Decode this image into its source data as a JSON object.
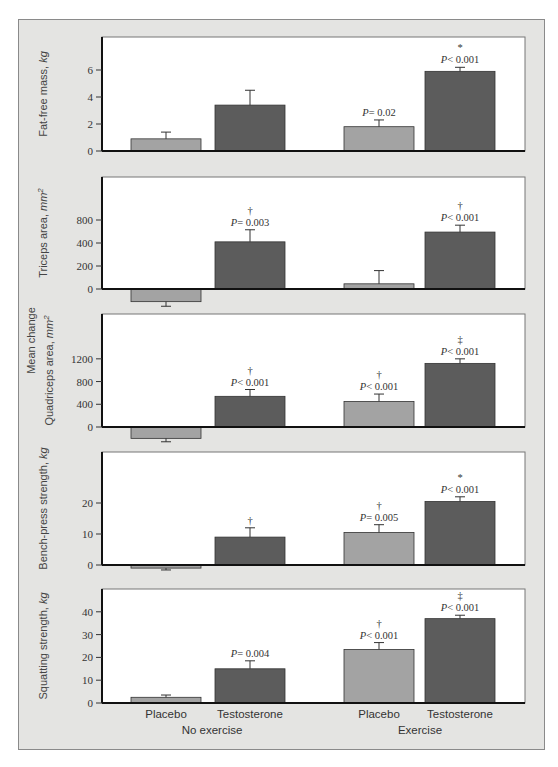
{
  "figure": {
    "background": "#e4e4e2",
    "shared_ylabel": "Mean change",
    "colors": {
      "placebo": "#a3a3a3",
      "testosterone": "#5c5c5c",
      "plot_bg": "#ffffff",
      "axis": "#111111"
    },
    "groups": [
      {
        "label": "No exercise",
        "bars": [
          "Placebo",
          "Testosterone"
        ]
      },
      {
        "label": "Exercise",
        "bars": [
          "Placebo",
          "Testosterone"
        ]
      }
    ]
  },
  "chart_data": [
    {
      "type": "bar",
      "title": "",
      "ylabel": "Fat-free mass, kg",
      "ylabel_main": "Fat-free mass, ",
      "ylabel_unit": "kg",
      "categories": [
        "No exercise / Placebo",
        "No exercise / Testosterone",
        "Exercise / Placebo",
        "Exercise / Testosterone"
      ],
      "values": [
        0.9,
        3.4,
        1.8,
        5.9
      ],
      "error_upper": [
        1.4,
        4.5,
        2.3,
        6.2
      ],
      "ylim": [
        0,
        7.8
      ],
      "ticks": [
        {
          "v": 0,
          "label": "0"
        },
        {
          "v": 2,
          "label": "2"
        },
        {
          "v": 4,
          "label": "4"
        },
        {
          "v": 6,
          "label": "6"
        }
      ],
      "annotations": [
        {
          "bar": 2,
          "symbol": "",
          "p": "P= 0.02"
        },
        {
          "bar": 3,
          "symbol": "*",
          "p": "P< 0.001"
        }
      ]
    },
    {
      "type": "bar",
      "ylabel": "Triceps area, mm2",
      "ylabel_main": "Triceps area, ",
      "ylabel_unit": "mm2",
      "categories": [
        "No exercise / Placebo",
        "No exercise / Testosterone",
        "Exercise / Placebo",
        "Exercise / Testosterone"
      ],
      "values": [
        -110,
        410,
        45,
        495
      ],
      "error_upper": [
        -150,
        515,
        160,
        555
      ],
      "ylim": [
        -150,
        850
      ],
      "ticks": [
        {
          "v": 0,
          "label": "0"
        },
        {
          "v": 200,
          "label": "200"
        },
        {
          "v": 400,
          "label": "400"
        },
        {
          "v": 600,
          "label": "800"
        }
      ],
      "annotations": [
        {
          "bar": 1,
          "symbol": "†",
          "p": "P= 0.003"
        },
        {
          "bar": 3,
          "symbol": "†",
          "p": "P< 0.001"
        }
      ]
    },
    {
      "type": "bar",
      "ylabel": "Quadriceps area, mm2",
      "ylabel_main": "Quadriceps area, ",
      "ylabel_unit": "mm2",
      "categories": [
        "No exercise / Placebo",
        "No exercise / Testosterone",
        "Exercise / Placebo",
        "Exercise / Testosterone"
      ],
      "values": [
        -200,
        540,
        450,
        1120
      ],
      "error_upper": [
        -260,
        660,
        580,
        1200
      ],
      "ylim": [
        -260,
        2000
      ],
      "ticks": [
        {
          "v": 0,
          "label": "0"
        },
        {
          "v": 400,
          "label": "400"
        },
        {
          "v": 800,
          "label": "800"
        },
        {
          "v": 1200,
          "label": "1200"
        }
      ],
      "annotations": [
        {
          "bar": 1,
          "symbol": "†",
          "p": "P< 0.001"
        },
        {
          "bar": 2,
          "symbol": "†",
          "p": "P< 0.001"
        },
        {
          "bar": 3,
          "symbol": "‡",
          "p": "P< 0.001"
        }
      ]
    },
    {
      "type": "bar",
      "ylabel": "Bench-press strength, kg",
      "ylabel_main": "Bench-press strength, ",
      "ylabel_unit": "kg",
      "categories": [
        "No exercise / Placebo",
        "No exercise / Testosterone",
        "Exercise / Placebo",
        "Exercise / Testosterone"
      ],
      "values": [
        -1,
        9,
        10.5,
        20.5
      ],
      "error_upper": [
        -1.6,
        12,
        13,
        22
      ],
      "ylim": [
        -2,
        36
      ],
      "ticks": [
        {
          "v": 0,
          "label": "0"
        },
        {
          "v": 10,
          "label": "10"
        },
        {
          "v": 20,
          "label": "20"
        }
      ],
      "annotations": [
        {
          "bar": 1,
          "symbol": "†",
          "p": ""
        },
        {
          "bar": 2,
          "symbol": "†",
          "p": "P= 0.005"
        },
        {
          "bar": 3,
          "symbol": "*",
          "p": "P< 0.001"
        }
      ]
    },
    {
      "type": "bar",
      "ylabel": "Squatting strength, kg",
      "ylabel_main": "Squatting strength, ",
      "ylabel_unit": "kg",
      "categories": [
        "No exercise / Placebo",
        "No exercise / Testosterone",
        "Exercise / Placebo",
        "Exercise / Testosterone"
      ],
      "values": [
        2.5,
        15,
        23.5,
        37
      ],
      "error_upper": [
        3.5,
        18.5,
        26.5,
        38.5
      ],
      "ylim": [
        0,
        50
      ],
      "ticks": [
        {
          "v": 0,
          "label": "0"
        },
        {
          "v": 10,
          "label": "10"
        },
        {
          "v": 20,
          "label": "20"
        },
        {
          "v": 30,
          "label": "30"
        },
        {
          "v": 40,
          "label": "40"
        }
      ],
      "annotations": [
        {
          "bar": 1,
          "symbol": "",
          "p": "P= 0.004"
        },
        {
          "bar": 2,
          "symbol": "†",
          "p": "P< 0.001"
        },
        {
          "bar": 3,
          "symbol": "‡",
          "p": "P< 0.001"
        }
      ],
      "xlabels": {
        "bars": [
          "Placebo",
          "Testosterone",
          "Placebo",
          "Testosterone"
        ],
        "groups": [
          "No exercise",
          "Exercise"
        ]
      }
    }
  ]
}
